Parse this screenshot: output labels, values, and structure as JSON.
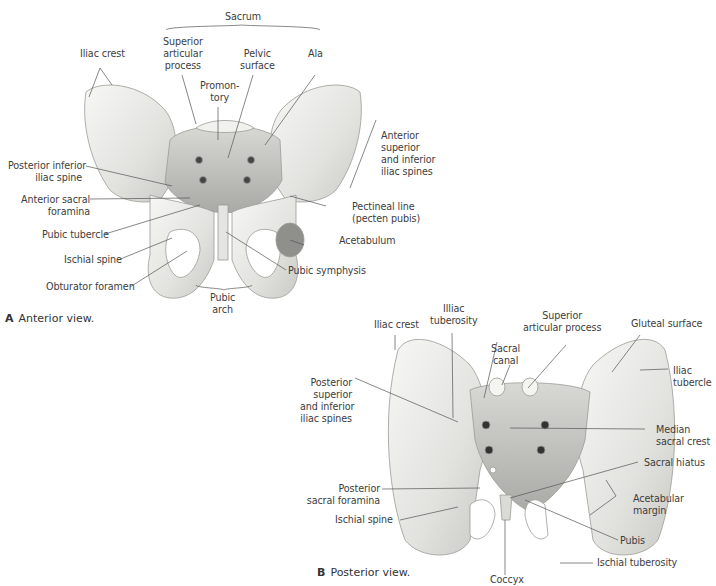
{
  "figure": {
    "header_fragment": "",
    "panel_a": {
      "caption_letter": "A",
      "caption_text": "Anterior view.",
      "labels": {
        "sacrum": "Sacrum",
        "iliac_crest": "Iliac crest",
        "superior_articular_process": [
          "Superior",
          "articular",
          "process"
        ],
        "pelvic_surface": [
          "Pelvic",
          "surface"
        ],
        "ala": "Ala",
        "promontory": [
          "Promon-",
          "tory"
        ],
        "anterior_superior_inferior_iliac_spines": [
          "Anterior",
          "superior",
          "and inferior",
          "iliac spines"
        ],
        "posterior_inferior_iliac_spine": [
          "Posterior inferior",
          "iliac spine"
        ],
        "anterior_sacral_foramina": [
          "Anterior sacral",
          "foramina"
        ],
        "pectineal_line": [
          "Pectineal line",
          "(pecten pubis)"
        ],
        "pubic_tubercle": "Pubic tubercle",
        "acetabulum": "Acetabulum",
        "ischial_spine": "Ischial spine",
        "pubic_symphysis": "Pubic symphysis",
        "obturator_foramen": "Obturator foramen",
        "pubic_arch": [
          "Pubic",
          "arch"
        ]
      }
    },
    "panel_b": {
      "caption_letter": "B",
      "caption_text": "Posterior view.",
      "labels": {
        "iliac_crest": "Iliac crest",
        "illiac_tuberosity": [
          "Illiac",
          "tuberosity"
        ],
        "superior_articular_process": [
          "Superior",
          "articular process"
        ],
        "gluteal_surface": "Gluteal surface",
        "sacral_canal": [
          "Sacral",
          "canal"
        ],
        "iliac_tubercle": [
          "Iliac",
          "tubercle"
        ],
        "posterior_superior_inferior_iliac_spines": [
          "Posterior",
          "superior",
          "and inferior",
          "iliac spines"
        ],
        "median_sacral_crest": [
          "Median",
          "sacral crest"
        ],
        "sacral_hiatus": "Sacral hiatus",
        "posterior_sacral_foramina": [
          "Posterior",
          "sacral foramina"
        ],
        "acetabular_margin": [
          "Acetabular",
          "margin"
        ],
        "ischial_spine": "Ischial spine",
        "pubis": "Pubis",
        "ischial_tuberosity": "Ischial tuberosity",
        "coccyx": "Coccyx"
      }
    }
  }
}
